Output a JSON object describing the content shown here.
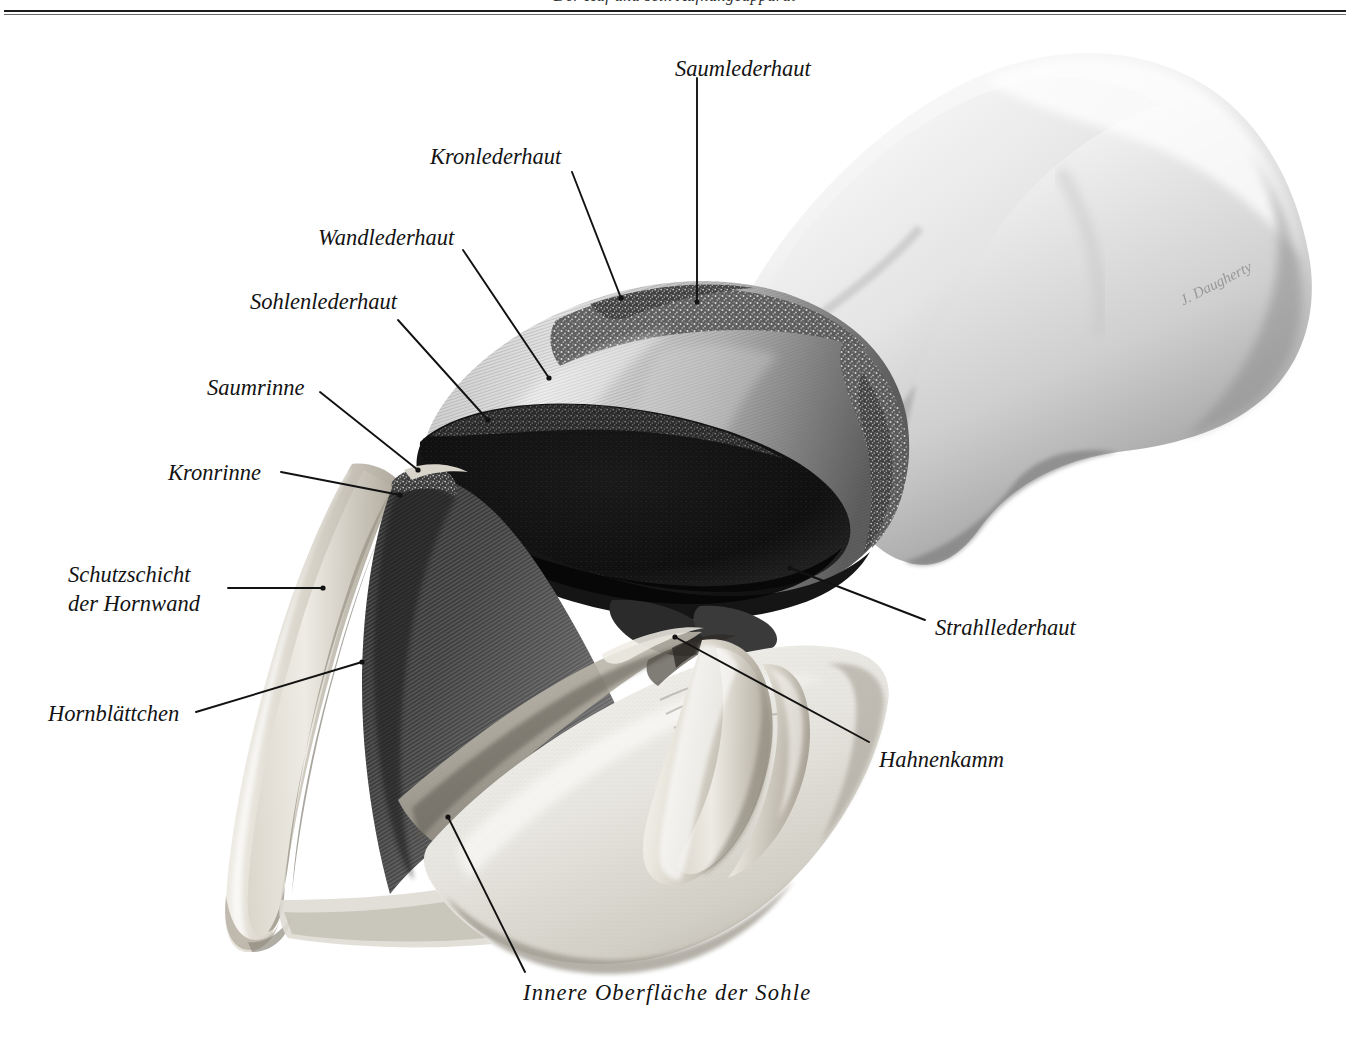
{
  "page": {
    "running_head": "Der Huf und sein Aufhängeapparat",
    "signature": "J. Daugherty"
  },
  "figure": {
    "labels": [
      {
        "id": "saumlederhaut",
        "text": "Saumlederhaut",
        "x": 675,
        "y": 55,
        "align": "left"
      },
      {
        "id": "kronlederhaut",
        "text": "Kronlederhaut",
        "x": 430,
        "y": 143,
        "align": "left"
      },
      {
        "id": "wandlederhaut",
        "text": "Wandlederhaut",
        "x": 318,
        "y": 224,
        "align": "left"
      },
      {
        "id": "sohlenlederhaut",
        "text": "Sohlenlederhaut",
        "x": 250,
        "y": 288,
        "align": "left"
      },
      {
        "id": "saumrinne",
        "text": "Saumrinne",
        "x": 207,
        "y": 374,
        "align": "left"
      },
      {
        "id": "kronrinne",
        "text": "Kronrinne",
        "x": 168,
        "y": 459,
        "align": "left"
      },
      {
        "id": "schutzschicht",
        "text": "Schutzschicht\nder Hornwand",
        "x": 68,
        "y": 561,
        "align": "left"
      },
      {
        "id": "hornblaettchen",
        "text": "Hornblättchen",
        "x": 48,
        "y": 700,
        "align": "left"
      },
      {
        "id": "strahllederhaut",
        "text": "Strahllederhaut",
        "x": 935,
        "y": 614,
        "align": "left"
      },
      {
        "id": "hahnenkamm",
        "text": "Hahnenkamm",
        "x": 879,
        "y": 746,
        "align": "left"
      },
      {
        "id": "innere-sohle",
        "text": "Innere Oberfläche der Sohle",
        "x": 523,
        "y": 979,
        "align": "left",
        "spaced": true
      }
    ],
    "leaders": [
      {
        "id": "leader-saumlederhaut",
        "from": [
          697,
          78
        ],
        "to": [
          697,
          302
        ],
        "dot": "end"
      },
      {
        "id": "leader-kronlederhaut",
        "from": [
          572,
          172
        ],
        "to": [
          621,
          298
        ],
        "dot": "end"
      },
      {
        "id": "leader-wandlederhaut",
        "from": [
          463,
          250
        ],
        "to": [
          549,
          378
        ],
        "dot": "end"
      },
      {
        "id": "leader-sohlenlederhaut",
        "from": [
          398,
          320
        ],
        "to": [
          488,
          420
        ],
        "dot": "end"
      },
      {
        "id": "leader-saumrinne",
        "from": [
          320,
          392
        ],
        "to": [
          418,
          470
        ],
        "dot": "end"
      },
      {
        "id": "leader-kronrinne",
        "from": [
          281,
          472
        ],
        "to": [
          400,
          495
        ],
        "dot": "end"
      },
      {
        "id": "leader-schutzschicht",
        "from": [
          228,
          588
        ],
        "to": [
          323,
          588
        ],
        "dot": "end"
      },
      {
        "id": "leader-hornblaettchen",
        "from": [
          196,
          712
        ],
        "to": [
          362,
          662
        ],
        "dot": "end"
      },
      {
        "id": "leader-strahllederhaut",
        "from": [
          925,
          620
        ],
        "to": [
          790,
          568
        ],
        "dot": "end"
      },
      {
        "id": "leader-hahnenkamm",
        "from": [
          869,
          742
        ],
        "to": [
          675,
          637
        ],
        "dot": "end"
      },
      {
        "id": "leader-innere-sohle",
        "from": [
          525,
          972
        ],
        "to": [
          448,
          817
        ],
        "dot": "end"
      }
    ],
    "style": {
      "leader_color": "#121212",
      "leader_width": 1.9,
      "label_color": "#131313",
      "paper": "#ffffff"
    }
  }
}
